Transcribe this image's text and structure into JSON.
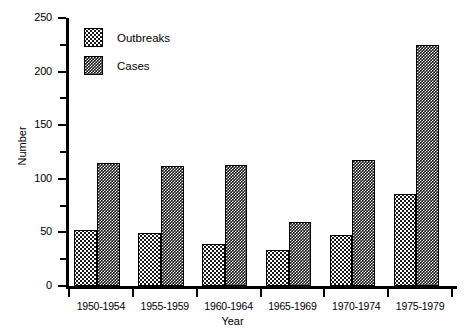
{
  "chart_data": {
    "type": "bar",
    "title": "",
    "subtitle": "",
    "xlabel": "Year",
    "ylabel": "Number",
    "categories": [
      "1950-1954",
      "1955-1959",
      "1960-1964",
      "1965-1969",
      "1970-1974",
      "1975-1979"
    ],
    "series": [
      {
        "name": "Outbreaks",
        "values": [
          52,
          49,
          39,
          34,
          48,
          86
        ]
      },
      {
        "name": "Cases",
        "values": [
          115,
          112,
          113,
          60,
          118,
          225
        ]
      }
    ],
    "ylim": [
      0,
      250
    ],
    "y_major_ticks": [
      0,
      50,
      100,
      150,
      200,
      250
    ],
    "y_minor_ticks": [
      25,
      75,
      125,
      175,
      225
    ],
    "y_tick_labels": [
      "0",
      "50",
      "100",
      "150",
      "200",
      "250"
    ],
    "grid": false,
    "legend_position": "top-left",
    "legend_entries": [
      "Outbreaks",
      "Cases"
    ],
    "colors": {
      "outbreaks_fill": "#ffffff",
      "outbreaks_pattern": "#1a1a1a",
      "cases_fill": "#111111",
      "cases_pattern": "#ffffff",
      "axis": "#000000",
      "background": "#ffffff"
    }
  }
}
